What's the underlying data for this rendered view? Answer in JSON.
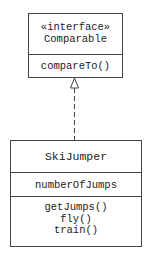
{
  "interface_box": {
    "stereotype": "«interface»",
    "name": "Comparable",
    "operations": [
      "compareTo()"
    ]
  },
  "class_box": {
    "name": "SkiJumper",
    "attributes": [
      "numberOfJumps"
    ],
    "operations": [
      "getJumps()",
      "fly()",
      "train()"
    ]
  },
  "relationship": {
    "type": "realization",
    "from": "SkiJumper",
    "to": "Comparable",
    "line_style": "dashed",
    "arrowhead": "hollow-triangle"
  },
  "colors": {
    "line": "#444444",
    "text": "#222222",
    "background": "#ffffff"
  }
}
